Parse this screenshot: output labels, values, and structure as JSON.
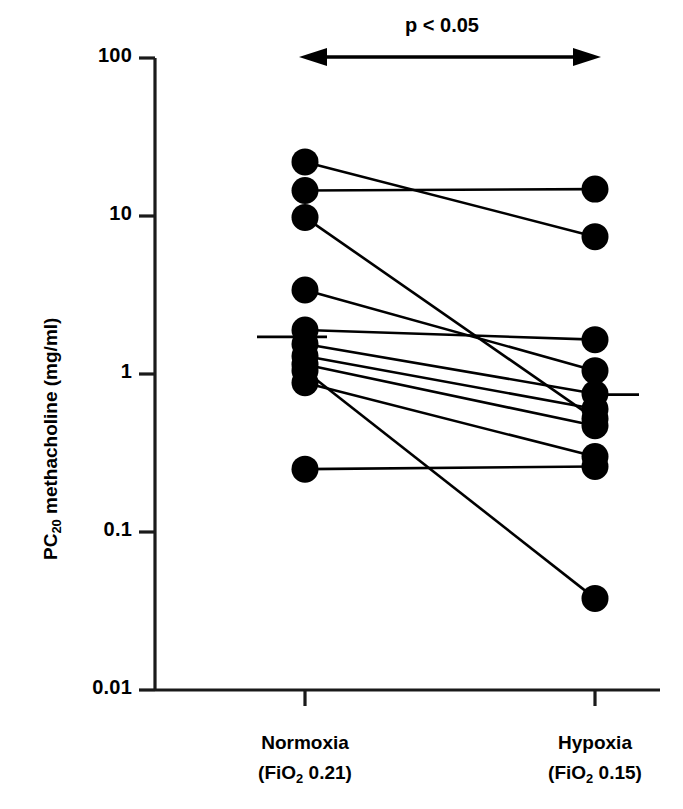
{
  "figure": {
    "ylabel_main": "PC",
    "ylabel_sub": "20",
    "ylabel_rest": " methacholine (mg/ml)",
    "annotation": "p < 0.05",
    "marker_color": "#000000",
    "line_color": "#000000",
    "axis_color": "#1a1a1a"
  },
  "xaxis": {
    "groups": [
      {
        "name": "Normoxia",
        "cond_open": "(FiO",
        "cond_sub": "2",
        "cond_value": "  0.21)"
      },
      {
        "name": "Hypoxia",
        "cond_open": "(FiO",
        "cond_sub": "2",
        "cond_value": "  0.15)"
      }
    ]
  },
  "chart_data": {
    "type": "line",
    "title": "",
    "xlabel": "",
    "ylabel": "PC20 methacholine (mg/ml)",
    "yscale": "log",
    "ylim": [
      0.01,
      100
    ],
    "ytick_labels": [
      "100",
      "10",
      "1",
      "0.1",
      "0.01"
    ],
    "ytick_values": [
      100,
      10,
      1,
      0.1,
      0.01
    ],
    "grid": false,
    "legend": null,
    "annotations": [
      {
        "text": "p < 0.05",
        "type": "double-arrow",
        "between": [
          "Normoxia",
          "Hypoxia"
        ]
      }
    ],
    "categories": [
      "Normoxia (FiO2 0.21)",
      "Hypoxia (FiO2 0.15)"
    ],
    "subjects": [
      {
        "id": 1,
        "normoxia": 22.0,
        "hypoxia": 7.4
      },
      {
        "id": 2,
        "normoxia": 14.5,
        "hypoxia": 14.8
      },
      {
        "id": 3,
        "normoxia": 9.8,
        "hypoxia": 0.52
      },
      {
        "id": 4,
        "normoxia": 3.4,
        "hypoxia": 1.05
      },
      {
        "id": 5,
        "normoxia": 1.9,
        "hypoxia": 1.65
      },
      {
        "id": 6,
        "normoxia": 1.55,
        "hypoxia": 0.75
      },
      {
        "id": 7,
        "normoxia": 1.3,
        "hypoxia": 0.6
      },
      {
        "id": 8,
        "normoxia": 1.15,
        "hypoxia": 0.47
      },
      {
        "id": 9,
        "normoxia": 1.05,
        "hypoxia": 0.038
      },
      {
        "id": 10,
        "normoxia": 0.88,
        "hypoxia": 0.3
      },
      {
        "id": 11,
        "normoxia": 0.25,
        "hypoxia": 0.26
      }
    ],
    "means": [
      {
        "group": "Normoxia (FiO2 0.21)",
        "value": 1.72
      },
      {
        "group": "Hypoxia (FiO2 0.15)",
        "value": 0.74
      }
    ]
  }
}
